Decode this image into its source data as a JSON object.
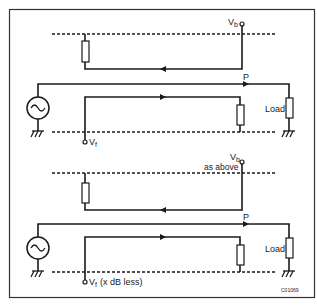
{
  "figure_id": "C01069",
  "colors": {
    "line": "#1a1a1a",
    "border": "#333333",
    "background": "#ffffff"
  },
  "panels": [
    {
      "vb_label": "V",
      "vb_sub": "b",
      "vb_note": "",
      "vf_label": "V",
      "vf_sub": "f",
      "vf_note": "",
      "p_label": "P",
      "load_label": "Load"
    },
    {
      "vb_label": "V",
      "vb_sub": "b",
      "vb_note": "as above",
      "vf_label": "V",
      "vf_sub": "f",
      "vf_note": "(x dB less)",
      "p_label": "P",
      "load_label": "Load"
    }
  ],
  "icons": {
    "source": "ac-source-icon",
    "ground": "ground-icon",
    "resistor": "resistor-icon",
    "terminal": "terminal-icon",
    "arrow": "arrow-icon"
  }
}
